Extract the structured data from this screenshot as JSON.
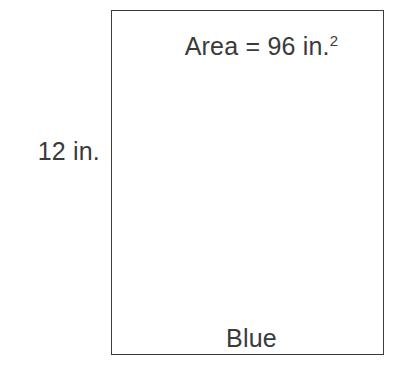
{
  "figure": {
    "type": "rectangle-area-diagram",
    "background_color": "#ffffff",
    "outline_color": "#3b3b3b",
    "text_color": "#3a3a3a",
    "shape": {
      "name": "rectangle",
      "region_label": "Blue"
    },
    "area_label": {
      "text": "Area = 96 in.",
      "exponent": "2",
      "full_text": "Area = 96 in.²",
      "value": 96,
      "unit": "in.²"
    },
    "height_label": {
      "text": "12 in.",
      "value": 12,
      "unit": "in."
    }
  }
}
